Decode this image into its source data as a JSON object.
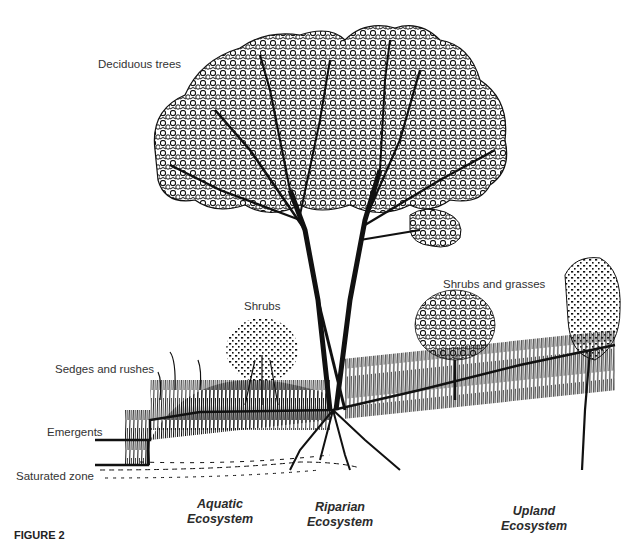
{
  "figure": {
    "labels": {
      "deciduous_trees": "Deciduous trees",
      "shrubs": "Shrubs",
      "shrubs_and_grasses": "Shrubs and grasses",
      "sedges_and_rushes": "Sedges and rushes",
      "emergents": "Emergents",
      "saturated_zone": "Saturated zone"
    },
    "zones": [
      {
        "line1": "Aquatic",
        "line2": "Ecosystem"
      },
      {
        "line1": "Riparian",
        "line2": "Ecosystem"
      },
      {
        "line1": "Upland",
        "line2": "Ecosystem"
      }
    ],
    "caption": {
      "number": "FIGURE 2",
      "text": "Cross-section of an ecosystem transect (truncated)"
    },
    "colors": {
      "ink": "#111111",
      "background": "#ffffff",
      "label_text": "#333333"
    }
  }
}
